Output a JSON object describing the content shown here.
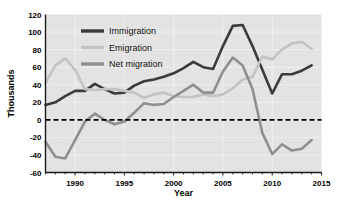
{
  "chart_data": {
    "type": "line",
    "title": "",
    "xlabel": "Year",
    "ylabel": "Thousands",
    "xlim": [
      1987,
      2015
    ],
    "ylim": [
      -60,
      120
    ],
    "ytick_step": 20,
    "grid": true,
    "legend_position": "top-left-inside",
    "zero_line": true,
    "x": [
      1987,
      1988,
      1989,
      1990,
      1991,
      1992,
      1993,
      1994,
      1995,
      1996,
      1997,
      1998,
      1999,
      2000,
      2001,
      2002,
      2003,
      2004,
      2005,
      2006,
      2007,
      2008,
      2009,
      2010,
      2011,
      2012,
      2013,
      2014
    ],
    "xtick_labels": [
      "1990",
      "1995",
      "2000",
      "2005",
      "2010",
      "2015"
    ],
    "xtick_values": [
      1990,
      1995,
      2000,
      2005,
      2010,
      2015
    ],
    "ytick_labels": [
      "120",
      "100",
      "80",
      "60",
      "40",
      "20",
      "0",
      "-20",
      "-40",
      "-60"
    ],
    "ytick_values": [
      120,
      100,
      80,
      60,
      40,
      20,
      0,
      -20,
      -40,
      -60
    ],
    "series": [
      {
        "name": "Immigration",
        "color": "#3b3b3b",
        "width": 2.6,
        "values": [
          17,
          20,
          27,
          33,
          33,
          41,
          35,
          30,
          31,
          39,
          44,
          46,
          49,
          53,
          59,
          66,
          60,
          58,
          84,
          107,
          108,
          84,
          57,
          30,
          52,
          52,
          56,
          62
        ]
      },
      {
        "name": "Emigration",
        "color": "#c3c3c3",
        "width": 2.6,
        "values": [
          42,
          62,
          70,
          57,
          35,
          34,
          35,
          35,
          33,
          31,
          25,
          29,
          31,
          27,
          26,
          26,
          29,
          27,
          29,
          36,
          46,
          49,
          72,
          69,
          80,
          87,
          89,
          81
        ]
      },
      {
        "name": "Net migration",
        "color": "#8f8f8f",
        "width": 2.6,
        "values": [
          -25,
          -42,
          -44,
          -23,
          -2,
          7,
          0,
          -5,
          -2,
          8,
          19,
          17,
          18,
          26,
          33,
          40,
          31,
          31,
          55,
          71,
          62,
          35,
          -15,
          -39,
          -28,
          -35,
          -33,
          -23
        ]
      }
    ]
  },
  "legend": {
    "items": [
      {
        "label": "Immigration",
        "color": "#3b3b3b"
      },
      {
        "label": "Emigration",
        "color": "#c3c3c3"
      },
      {
        "label": "Net migration",
        "color": "#8f8f8f"
      }
    ]
  },
  "axes": {
    "y_title": "Thousands",
    "x_title": "Year"
  }
}
